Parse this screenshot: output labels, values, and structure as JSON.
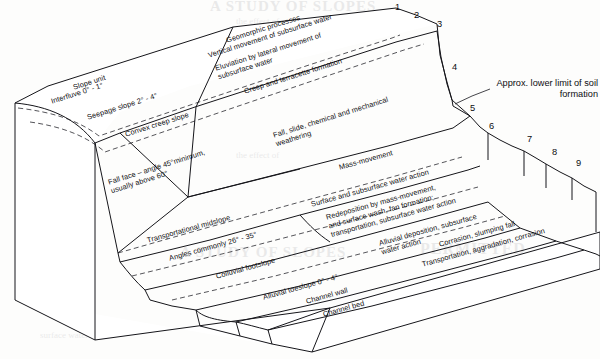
{
  "diagram": {
    "line_color": "#15151a",
    "background_color": "#fdfdfc"
  },
  "columns": {
    "slope_unit_header": "Slope unit",
    "process_header": "Geomorphic processes"
  },
  "slope_units": [
    {
      "number": "1",
      "name": "Interfluve  0° - 1°",
      "process": "Vertical movement of subsurface water"
    },
    {
      "number": "2",
      "name": "Seepage slope 2° - 4°",
      "process": "Eluviation by lateral movement of"
    },
    {
      "number": "3",
      "name": "Convex creep slope",
      "process": "Creep and terracette formation"
    },
    {
      "number": "4",
      "name": "Fall face – angle 45°minimum,",
      "process": "Fall, slide, chemical and mechanical"
    },
    {
      "number": "5",
      "name": "Transportational midslope",
      "process": "Mass-movement"
    },
    {
      "number": "6",
      "name": "Colluvial footslope",
      "process": "Redeposition by mass-movement,"
    },
    {
      "number": "7",
      "name": "Alluvial toeslope 0° - 4°",
      "process": "Alluvial deposition, subsurface"
    },
    {
      "number": "8",
      "name": "Channel wall",
      "process": "Corrasion, slumping fall"
    },
    {
      "number": "9",
      "name": "Channel bed",
      "process": "Transportation, aggradation, corrasion"
    }
  ],
  "labels": {
    "slope_unit": "Slope unit",
    "interfluve": "Interfluve   0° - 1°",
    "seepage_slope": "Seepage slope 2° - 4°",
    "convex_creep_slope": "Convex creep slope",
    "fall_face_line1": "Fall face – angle 45°minimum,",
    "fall_face_line2": "usually above 60°",
    "transportational_midslope": "Transportational midslope",
    "angles_commonly": "Angles commonly 26° - 35°",
    "colluvial_footslope": "Colluvial footslope",
    "alluvial_toeslope": "Alluvial toeslope 0° - 4°",
    "channel_wall": "Channel wall",
    "channel_bed": "Channel bed",
    "geomorphic_processes": "Geomorphic processes",
    "vertical_movement": "Vertical movement of subsurface water",
    "eluviation_line1": "Eluviation by lateral movement of",
    "eluviation_line2": "subsurface water",
    "creep_terracette": "Creep and terracette formation",
    "fall_slide_line1": "Fall, slide, chemical and mechanical",
    "fall_slide_line2": "weathering",
    "mass_movement": "Mass-movement",
    "surface_subsurface_water_action": "Surface and subsurface water action",
    "redeposition_line1": "Redeposition by mass-movement,",
    "redeposition_line2": "and surface wash, fan formation;",
    "redeposition_line3": "transportation, subsurface water action",
    "alluvial_deposition_line1": "Alluvial deposition, subsurface",
    "alluvial_deposition_line2": "water action",
    "corrasion_slumping": "Corrasion, slumping fall",
    "transportation_aggradation": "Transportation, aggradation, corrasion"
  },
  "annotation": {
    "soil_limit_line1": "Approx. lower limit of soil",
    "soil_limit_line2": "formation"
  },
  "ghost_text": {
    "note": "faint show-through of text printed on the reverse of the scanned page",
    "lines": [
      "PERMITTED",
      "Discussion",
      "A STUDY OF SLOPES",
      "the effect of",
      "surface water"
    ]
  }
}
